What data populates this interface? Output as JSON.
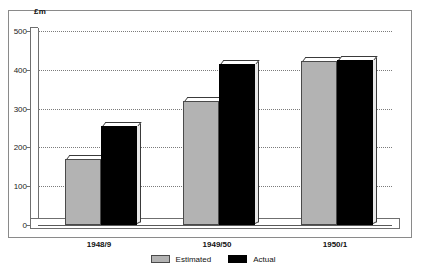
{
  "chart_data": {
    "type": "bar",
    "title": "",
    "subtitle": "",
    "xlabel": "",
    "ylabel": "£m",
    "ylim": [
      0,
      500
    ],
    "yticks": [
      0,
      100,
      200,
      300,
      400,
      500
    ],
    "grid": true,
    "legend_position": "bottom-center",
    "categories": [
      "1948/9",
      "1949/50",
      "1950/1"
    ],
    "series": [
      {
        "name": "Estimated",
        "color": "#b3b3b3",
        "values": [
          170,
          320,
          422
        ]
      },
      {
        "name": "Actual",
        "color": "#000000",
        "values": [
          255,
          415,
          425
        ]
      }
    ]
  },
  "axis": {
    "unit_label": "£m",
    "tick_labels": [
      "500",
      "400",
      "300",
      "200",
      "100",
      "0"
    ]
  },
  "categories": [
    {
      "label": "1948/9"
    },
    {
      "label": "1949/50"
    },
    {
      "label": "1950/1"
    }
  ],
  "legend": {
    "items": [
      {
        "label": "Estimated",
        "swatch": "estimated"
      },
      {
        "label": "Actual",
        "swatch": "actual"
      }
    ]
  }
}
